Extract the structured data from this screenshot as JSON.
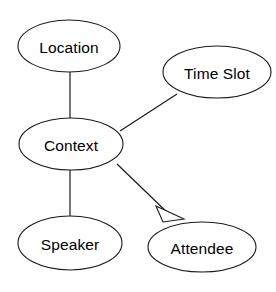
{
  "diagram": {
    "type": "entity-relationship-graph",
    "background_color": "#ffffff",
    "stroke_color": "#1a1a1a",
    "text_color": "#000000",
    "nodes": [
      {
        "id": "location",
        "label": "Location",
        "shape": "ellipse",
        "cx": 69,
        "cy": 46,
        "rx": 51,
        "ry": 26
      },
      {
        "id": "time-slot",
        "label": "Time Slot",
        "shape": "ellipse",
        "cx": 217,
        "cy": 72,
        "rx": 54,
        "ry": 26
      },
      {
        "id": "context",
        "label": "Context",
        "shape": "ellipse",
        "cx": 71,
        "cy": 144,
        "rx": 52,
        "ry": 26
      },
      {
        "id": "speaker",
        "label": "Speaker",
        "shape": "ellipse",
        "cx": 70,
        "cy": 243,
        "rx": 52,
        "ry": 27
      },
      {
        "id": "attendee",
        "label": "Attendee",
        "shape": "ellipse",
        "cx": 202,
        "cy": 247,
        "rx": 54,
        "ry": 25
      }
    ],
    "edges": [
      {
        "id": "edge-location-context",
        "from": "location",
        "to": "context",
        "style": "plain-line",
        "arrowhead": "none",
        "x1": 70,
        "y1": 71,
        "x2": 70,
        "y2": 118
      },
      {
        "id": "edge-context-time-slot",
        "from": "context",
        "to": "time-slot",
        "style": "plain-line",
        "arrowhead": "none",
        "x1": 120,
        "y1": 131,
        "x2": 177,
        "y2": 94
      },
      {
        "id": "edge-context-speaker",
        "from": "context",
        "to": "speaker",
        "style": "plain-line",
        "arrowhead": "none",
        "x1": 70,
        "y1": 170,
        "x2": 70,
        "y2": 217
      },
      {
        "id": "edge-context-attendee",
        "from": "context",
        "to": "attendee",
        "style": "plain-line",
        "arrowhead": "hollow-triangle",
        "x1": 117,
        "y1": 164,
        "x2": 172,
        "y2": 217
      }
    ],
    "arrowhead": {
      "id": "attendee-generalization-arrowhead",
      "kind": "hollow-triangle",
      "points": "156,206 184,219 163,222",
      "fill": "#ffffff"
    }
  }
}
